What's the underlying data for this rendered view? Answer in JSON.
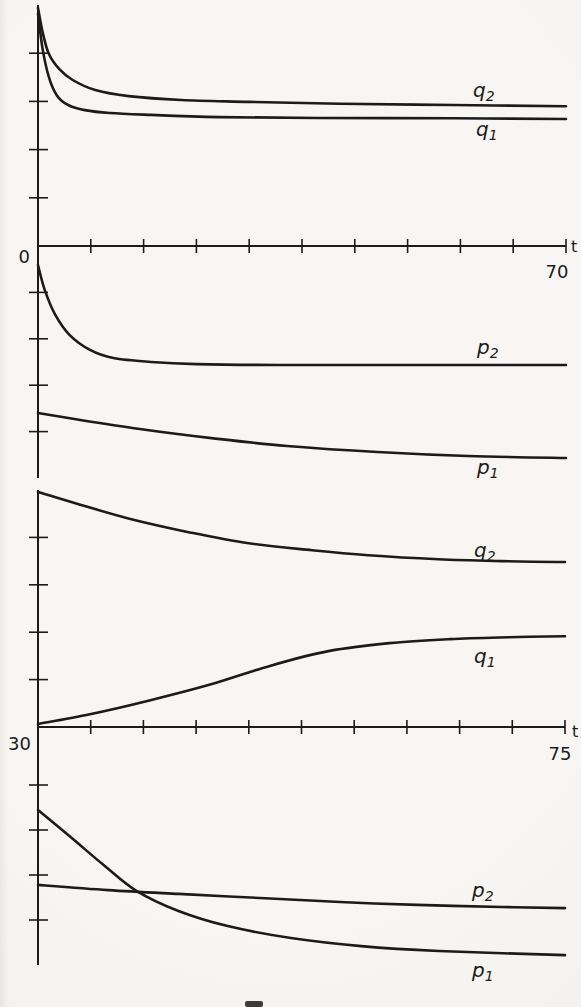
{
  "figure": {
    "ink_color": "#1b1b1b",
    "paper_color": "#f7f6f2"
  },
  "chart_data": [
    {
      "type": "line",
      "panel": "panel-1",
      "xlabel": "t",
      "ylabel": "",
      "x_range": [
        0,
        70
      ],
      "x_start_label": "0",
      "x_end_label": "70",
      "x_letter": "t",
      "grid": false,
      "legend": "inline-labels",
      "x_ticks": [
        7,
        14,
        21,
        28,
        35,
        42,
        49,
        56,
        63,
        70
      ],
      "y_ticks": [
        20,
        40,
        60,
        80
      ],
      "series": [
        {
          "name": "q2",
          "label_main": "q",
          "label_sub": "2",
          "points": [
            [
              0,
              98.8
            ],
            [
              0.6,
              89
            ],
            [
              1.4,
              80
            ],
            [
              2.8,
              73.5
            ],
            [
              4.6,
              68.9
            ],
            [
              7.6,
              64.7
            ],
            [
              12,
              62.2
            ],
            [
              19,
              60.6
            ],
            [
              28,
              59.8
            ],
            [
              40,
              59
            ],
            [
              55,
              58.5
            ],
            [
              70,
              58
            ]
          ]
        },
        {
          "name": "q1",
          "label_main": "q",
          "label_sub": "1",
          "points": [
            [
              0,
              96.3
            ],
            [
              0.6,
              82
            ],
            [
              1.4,
              70.5
            ],
            [
              2.5,
              62.5
            ],
            [
              4,
              58.5
            ],
            [
              6.2,
              56.4
            ],
            [
              9.5,
              55.2
            ],
            [
              15,
              54.4
            ],
            [
              24,
              53.5
            ],
            [
              37,
              53.1
            ],
            [
              55,
              53
            ],
            [
              70,
              52.7
            ]
          ]
        }
      ]
    },
    {
      "type": "line",
      "panel": "panel-2",
      "xlabel": "t",
      "ylabel": "",
      "x_range": [
        0,
        70
      ],
      "grid": false,
      "legend": "inline-labels",
      "x_ticks": [],
      "y_ticks": [
        20,
        40,
        60,
        80
      ],
      "series": [
        {
          "name": "p2",
          "label_main": "p",
          "label_sub": "2",
          "points": [
            [
              0,
              91.8
            ],
            [
              0.9,
              81
            ],
            [
              2.3,
              70.3
            ],
            [
              4.2,
              61.6
            ],
            [
              6.9,
              55.2
            ],
            [
              10,
              51.7
            ],
            [
              15,
              50
            ],
            [
              21,
              49.1
            ],
            [
              32,
              48.7
            ],
            [
              48,
              48.7
            ],
            [
              70,
              48.7
            ]
          ]
        },
        {
          "name": "p1",
          "label_main": "p",
          "label_sub": "1",
          "points": [
            [
              0,
              28
            ],
            [
              5.6,
              25
            ],
            [
              13.5,
              21.1
            ],
            [
              23,
              17.2
            ],
            [
              33,
              13.8
            ],
            [
              45,
              11.2
            ],
            [
              57,
              9.5
            ],
            [
              70,
              8.6
            ]
          ]
        }
      ]
    },
    {
      "type": "line",
      "panel": "panel-3",
      "xlabel": "t",
      "ylabel": "",
      "x_range": [
        0,
        75
      ],
      "x_start_label": "30",
      "x_end_label": "75",
      "x_letter": "t",
      "grid": false,
      "legend": "inline-labels",
      "x_ticks": [
        7.5,
        15,
        22.5,
        30,
        37.5,
        45,
        52.5,
        60,
        67.5,
        75
      ],
      "y_ticks": [
        20,
        40,
        60,
        80
      ],
      "series": [
        {
          "name": "q2",
          "label_main": "q",
          "label_sub": "2",
          "points": [
            [
              0,
              99.2
            ],
            [
              6,
              93.8
            ],
            [
              13,
              87.9
            ],
            [
              21.6,
              82.1
            ],
            [
              30,
              77.5
            ],
            [
              39,
              74.6
            ],
            [
              47,
              72.5
            ],
            [
              57,
              70.8
            ],
            [
              66,
              70
            ],
            [
              75,
              69.6
            ]
          ]
        },
        {
          "name": "q1",
          "label_main": "q",
          "label_sub": "1",
          "points": [
            [
              0,
              1.3
            ],
            [
              7.4,
              5.4
            ],
            [
              16,
              11.3
            ],
            [
              24.5,
              17.9
            ],
            [
              33,
              25.8
            ],
            [
              41.5,
              32.1
            ],
            [
              50,
              35.4
            ],
            [
              58.6,
              37.1
            ],
            [
              67,
              37.9
            ],
            [
              75,
              38.3
            ]
          ]
        }
      ]
    },
    {
      "type": "line",
      "panel": "panel-4",
      "xlabel": "t",
      "ylabel": "",
      "x_range": [
        0,
        75
      ],
      "grid": false,
      "legend": "inline-labels",
      "x_ticks": [],
      "y_ticks": [
        20,
        40,
        60,
        80
      ],
      "series": [
        {
          "name": "p2",
          "label_main": "p",
          "label_sub": "2",
          "points": [
            [
              0,
              35.6
            ],
            [
              10,
              33.3
            ],
            [
              20,
              31.6
            ],
            [
              31.6,
              29.8
            ],
            [
              43,
              28
            ],
            [
              54,
              26.7
            ],
            [
              66,
              25.8
            ],
            [
              75,
              25.3
            ]
          ]
        },
        {
          "name": "p1",
          "label_main": "p",
          "label_sub": "1",
          "points": [
            [
              0,
              68.9
            ],
            [
              4.6,
              57
            ],
            [
              9.5,
              44
            ],
            [
              14,
              33
            ],
            [
              20,
              24
            ],
            [
              27,
              17.3
            ],
            [
              36,
              12
            ],
            [
              46,
              8.4
            ],
            [
              57,
              6.2
            ],
            [
              75,
              4.4
            ]
          ]
        }
      ]
    }
  ]
}
